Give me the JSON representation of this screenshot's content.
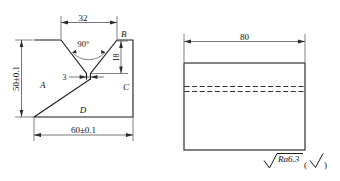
{
  "drawing": {
    "background_color": "#ffffff",
    "line_color": "#1a1a1a",
    "views": {
      "front": {
        "name": "front-view-v-groove",
        "dimensions": {
          "groove_width": "32",
          "groove_angle": "90°",
          "root_face_height": "18",
          "root_gap": "3",
          "overall_height": "50±0.1",
          "overall_width": "60±0.1"
        },
        "edge_labels": {
          "left": "A",
          "top_right": "B",
          "right": "C",
          "bottom": "D"
        }
      },
      "side": {
        "name": "side-view-plate",
        "dimensions": {
          "length": "80"
        }
      }
    },
    "surface_finish": {
      "value": "Ra6.3",
      "bracket_open": "(",
      "bracket_close": ")"
    }
  }
}
